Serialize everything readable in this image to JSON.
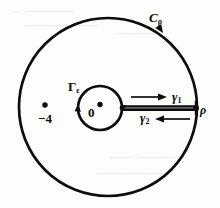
{
  "figure": {
    "kind": "complex-contour-diagram",
    "width": 220,
    "height": 208,
    "background_color": "#fdfdfc",
    "ink_color": "#0d0d0d",
    "geometry": {
      "outer_circle": {
        "cx": 108,
        "cy": 107,
        "r": 89,
        "stroke_width": 2.6
      },
      "inner_circle": {
        "cx": 100,
        "cy": 108,
        "r": 22,
        "stroke_width": 2.6
      },
      "cut_segment": {
        "x1": 122,
        "y1": 108,
        "x2": 197,
        "y2": 108
      },
      "origin_dot": {
        "cx": 100,
        "cy": 105,
        "r": 2.6
      },
      "pole_dot": {
        "cx": 45,
        "cy": 106,
        "r": 2.6
      },
      "rho_endpoint_dot": {
        "cx": 196,
        "cy": 108,
        "r": 2.8
      }
    },
    "labels": {
      "outer_contour": "C",
      "outer_contour_sub": "ρ",
      "inner_contour": "Γ",
      "inner_contour_sub": "ε",
      "upper_edge": "γ",
      "upper_edge_sub": "1",
      "lower_edge": "γ",
      "lower_edge_sub": "2",
      "inner_radius": "ε",
      "outer_radius": "ρ",
      "origin": "0",
      "pole": "−4"
    },
    "arrows": {
      "outer_circle_direction": "counterclockwise-marker-top-right",
      "inner_circle_direction": "marker-left",
      "upper_edge_direction": "right",
      "lower_edge_direction": "left"
    }
  },
  "ghost_text": {
    "line1": "— ————",
    "line2": "———— ——",
    "line3": "————",
    "line4": "—— ———",
    "line5": "——————"
  }
}
